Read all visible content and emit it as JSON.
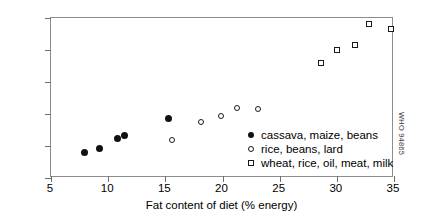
{
  "chart_data": {
    "type": "scatter",
    "title": "",
    "xlabel": "Fat content of diet (% energy)",
    "ylabel": "body mass index (men)",
    "xlim": [
      5,
      35
    ],
    "ylim": [
      20,
      25
    ],
    "xticks": [
      5,
      10,
      15,
      20,
      25,
      30,
      35
    ],
    "yticks": [
      20,
      21,
      22,
      23,
      24,
      25
    ],
    "grid": false,
    "legend_position": "inside-bottom-right",
    "series": [
      {
        "name": "cassava, maize, beans",
        "marker": "filled-circle",
        "color": "#111111",
        "points": [
          {
            "x": 7.9,
            "y": 20.8
          },
          {
            "x": 9.2,
            "y": 20.93
          },
          {
            "x": 10.8,
            "y": 21.25
          },
          {
            "x": 11.4,
            "y": 21.32
          },
          {
            "x": 15.3,
            "y": 21.85
          }
        ]
      },
      {
        "name": "rice, beans, lard",
        "marker": "open-circle",
        "color": "#1a1a1a",
        "points": [
          {
            "x": 15.6,
            "y": 21.2
          },
          {
            "x": 18.1,
            "y": 21.75
          },
          {
            "x": 19.9,
            "y": 21.95
          },
          {
            "x": 21.3,
            "y": 22.2
          },
          {
            "x": 23.1,
            "y": 22.15
          }
        ]
      },
      {
        "name": "wheat, rice, oil, meat, milk",
        "marker": "open-square",
        "color": "#1a1a1a",
        "points": [
          {
            "x": 28.6,
            "y": 23.6
          },
          {
            "x": 30.0,
            "y": 24.0
          },
          {
            "x": 31.6,
            "y": 24.15
          },
          {
            "x": 32.8,
            "y": 24.8
          },
          {
            "x": 34.7,
            "y": 24.65
          }
        ]
      }
    ]
  },
  "legend": {
    "items": [
      {
        "marker": "filled-circle",
        "label": "cassava, maize, beans"
      },
      {
        "marker": "open-circle",
        "label": "rice, beans, lard"
      },
      {
        "marker": "open-square",
        "label": "wheat, rice, oil, meat, milk"
      }
    ]
  },
  "watermark": {
    "text": "WHO 94865"
  }
}
